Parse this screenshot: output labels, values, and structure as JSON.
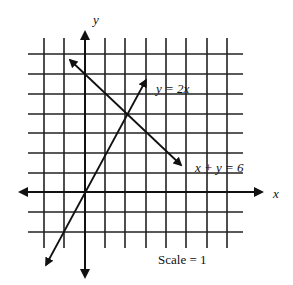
{
  "diagram": {
    "type": "coordinate-plane",
    "axes": {
      "x_label": "x",
      "y_label": "y"
    },
    "grid": {
      "x_range": [
        -2,
        8
      ],
      "y_range": [
        -3,
        7
      ],
      "scale_label": "Scale = 1"
    },
    "lines": [
      {
        "equation": "y = 2x",
        "label": "y = 2x"
      },
      {
        "equation": "x + y = 6",
        "label": "x + y = 6"
      }
    ],
    "intersection": {
      "x": 2,
      "y": 4
    },
    "colors": {
      "ink": "#111111",
      "background": "#ffffff"
    }
  }
}
